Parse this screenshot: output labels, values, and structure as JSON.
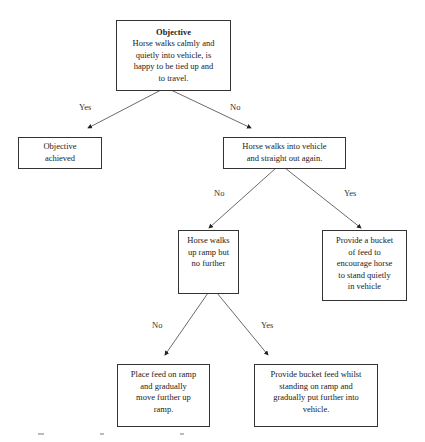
{
  "diagram": {
    "type": "decision-flowchart",
    "nodes": {
      "objective": {
        "title": "Objective",
        "lines": [
          "Horse walks calmly and",
          "quietly into vehicle, is",
          "happy to be tied up and",
          "to travel."
        ]
      },
      "achieved": {
        "lines": [
          "Objective",
          "achieved"
        ]
      },
      "walks_out": {
        "lines": [
          "Horse walks into vehicle",
          "and straight out again."
        ]
      },
      "up_ramp": {
        "lines": [
          "Horse walks",
          "up ramp but",
          "no further"
        ]
      },
      "bucket_vehicle": {
        "lines": [
          "Provide a bucket",
          "of feed to",
          "encourage horse",
          "to stand quietly",
          "in vehicle"
        ]
      },
      "feed_ramp": {
        "lines": [
          "Place feed on ramp",
          "and gradually",
          "move further up",
          "ramp."
        ]
      },
      "bucket_ramp": {
        "lines": [
          "Provide bucket feed whilst",
          "standing on ramp and",
          "gradually put further into",
          "vehicle."
        ]
      }
    },
    "edges": [
      {
        "from": "objective",
        "to": "achieved",
        "label": "Yes"
      },
      {
        "from": "objective",
        "to": "walks_out",
        "label": "No"
      },
      {
        "from": "walks_out",
        "to": "up_ramp",
        "label": "No"
      },
      {
        "from": "walks_out",
        "to": "bucket_vehicle",
        "label": "Yes"
      },
      {
        "from": "up_ramp",
        "to": "feed_ramp",
        "label": "No"
      },
      {
        "from": "up_ramp",
        "to": "bucket_ramp",
        "label": "Yes"
      }
    ],
    "colors": {
      "line": "#333333",
      "background": "#ffffff"
    }
  }
}
